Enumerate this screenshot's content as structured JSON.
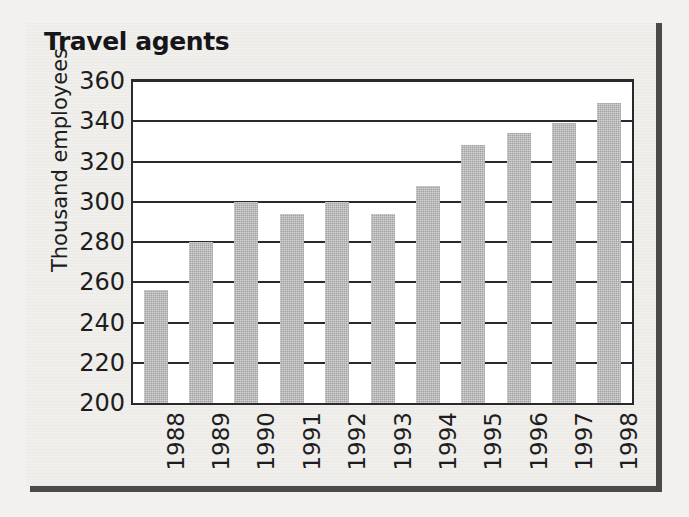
{
  "chart_data": {
    "type": "bar",
    "title": "Travel agents",
    "xlabel": "",
    "ylabel": "Thousand employees",
    "categories": [
      "1988",
      "1989",
      "1990",
      "1991",
      "1992",
      "1993",
      "1994",
      "1995",
      "1996",
      "1997",
      "1998"
    ],
    "values": [
      256,
      280,
      300,
      294,
      300,
      294,
      308,
      328,
      334,
      339,
      349
    ],
    "ylim": [
      200,
      360
    ],
    "ytick_step": 20,
    "yticks": [
      "360",
      "340",
      "320",
      "300",
      "280",
      "260",
      "240",
      "220",
      "200"
    ],
    "grid": "horizontal",
    "legend": "none",
    "series": [
      {
        "name": "Thousand employees",
        "values": [
          256,
          280,
          300,
          294,
          300,
          294,
          308,
          328,
          334,
          339,
          349
        ]
      }
    ]
  },
  "style": {
    "bar_color": "#a3a3a3",
    "axis_color": "#2a2a2c",
    "text_color": "#1d1d20",
    "page_background": "#f0efec",
    "rule_color": "#4a4a4a",
    "plot_background": "#ffffff"
  }
}
